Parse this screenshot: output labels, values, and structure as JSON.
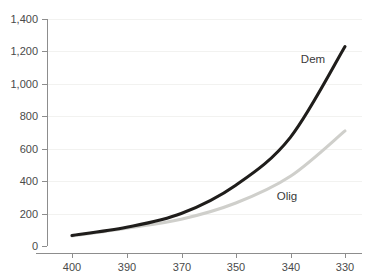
{
  "chart_data": {
    "type": "line",
    "title": "",
    "subtitle": "",
    "xlabel": "",
    "ylabel": "",
    "x": [
      400,
      390,
      370,
      350,
      340,
      330
    ],
    "x_tick_labels": [
      "400",
      "390",
      "370",
      "350",
      "340",
      "330"
    ],
    "x_axis_reversed": true,
    "xlim": [
      400,
      330
    ],
    "ylim": [
      0,
      1400
    ],
    "y_ticks": [
      0,
      200,
      400,
      600,
      800,
      1000,
      1200,
      1400
    ],
    "y_tick_labels": [
      "0",
      "200",
      "400",
      "600",
      "800",
      "1,000",
      "1,200",
      "1,400"
    ],
    "grid": true,
    "legend_position": "inline-annotation",
    "series": [
      {
        "name": "Dem",
        "label": "Dem",
        "color": "#1f1d1b",
        "values": [
          65,
          115,
          200,
          375,
          670,
          1230
        ]
      },
      {
        "name": "Olig",
        "label": "Olig",
        "color": "#cfcfcb",
        "values": [
          62,
          110,
          165,
          265,
          430,
          710
        ]
      }
    ],
    "annotations": [
      {
        "text": "Dem",
        "x": 338,
        "y": 1075
      },
      {
        "text": "Olig",
        "x": 342,
        "y": 300
      }
    ]
  },
  "colors": {
    "background": "#ffffff",
    "axis": "#8d8d8d",
    "gridline": "#f2f2f0",
    "text": "#4a4a4a",
    "series_dem": "#1f1d1b",
    "series_olig": "#cfcfcb"
  }
}
